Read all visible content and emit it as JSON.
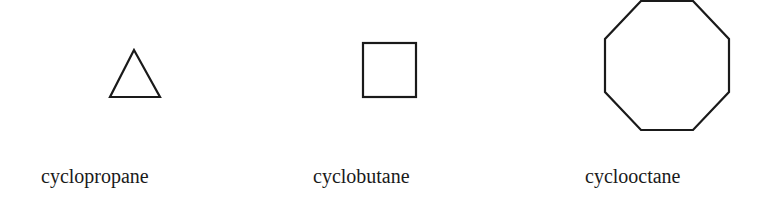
{
  "diagram": {
    "stroke_color": "#1a1a1a",
    "background": "#ffffff",
    "molecules": [
      {
        "name": "cyclopropane",
        "shape": "triangle",
        "sides": 3
      },
      {
        "name": "cyclobutane",
        "shape": "square",
        "sides": 4
      },
      {
        "name": "cyclooctane",
        "shape": "octagon",
        "sides": 8
      }
    ]
  }
}
